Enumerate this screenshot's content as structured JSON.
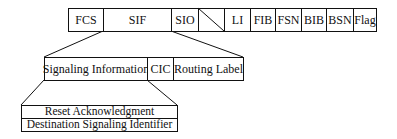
{
  "diagram": {
    "frame_fields": [
      {
        "label": "FCS"
      },
      {
        "label": "SIF"
      },
      {
        "label": "SIO"
      },
      {
        "label": ""
      },
      {
        "label": "LI"
      },
      {
        "label": "FIB"
      },
      {
        "label": "FSN"
      },
      {
        "label": "BIB"
      },
      {
        "label": "BSN"
      },
      {
        "label": "Flag"
      }
    ],
    "sif_fields": [
      {
        "label": "Signaling Information"
      },
      {
        "label": "CIC"
      },
      {
        "label": "Routing Label"
      }
    ],
    "signaling_info_fields": [
      {
        "label": "Reset Acknowledgment"
      },
      {
        "label": "Destination Signaling Identifier"
      }
    ]
  }
}
